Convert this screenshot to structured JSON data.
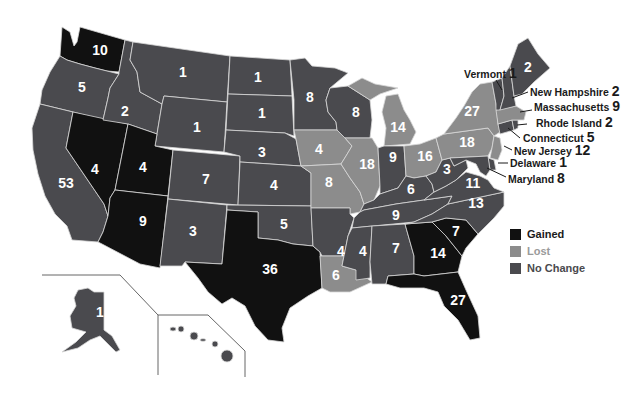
{
  "colors": {
    "gained": "#111111",
    "lost": "#8c8c8c",
    "no_change": "#4a4a4e",
    "border": "#d8d8d8",
    "label_dark": "#1a1a1a",
    "label_light": "#ffffff"
  },
  "legend": {
    "items": [
      {
        "key": "gained",
        "label": "Gained",
        "color": "#111111",
        "text_color": "#1a1a1a"
      },
      {
        "key": "lost",
        "label": "Lost",
        "color": "#8c8c8c",
        "text_color": "#9a9a9a"
      },
      {
        "key": "no_change",
        "label": "No Change",
        "color": "#4a4a4e",
        "text_color": "#4a4a4e"
      }
    ]
  },
  "states": {
    "WA": {
      "name": "Washington",
      "seats": "10",
      "status": "gained"
    },
    "OR": {
      "name": "Oregon",
      "seats": "5",
      "status": "no_change"
    },
    "CA": {
      "name": "California",
      "seats": "53",
      "status": "no_change"
    },
    "NV": {
      "name": "Nevada",
      "seats": "4",
      "status": "gained"
    },
    "ID": {
      "name": "Idaho",
      "seats": "2",
      "status": "no_change"
    },
    "MT": {
      "name": "Montana",
      "seats": "1",
      "status": "no_change"
    },
    "WY": {
      "name": "Wyoming",
      "seats": "1",
      "status": "no_change"
    },
    "UT": {
      "name": "Utah",
      "seats": "4",
      "status": "gained"
    },
    "AZ": {
      "name": "Arizona",
      "seats": "9",
      "status": "gained"
    },
    "CO": {
      "name": "Colorado",
      "seats": "7",
      "status": "no_change"
    },
    "NM": {
      "name": "New Mexico",
      "seats": "3",
      "status": "no_change"
    },
    "ND": {
      "name": "North Dakota",
      "seats": "1",
      "status": "no_change"
    },
    "SD": {
      "name": "South Dakota",
      "seats": "1",
      "status": "no_change"
    },
    "NE": {
      "name": "Nebraska",
      "seats": "3",
      "status": "no_change"
    },
    "KS": {
      "name": "Kansas",
      "seats": "4",
      "status": "no_change"
    },
    "OK": {
      "name": "Oklahoma",
      "seats": "5",
      "status": "no_change"
    },
    "TX": {
      "name": "Texas",
      "seats": "36",
      "status": "gained"
    },
    "MN": {
      "name": "Minnesota",
      "seats": "8",
      "status": "no_change"
    },
    "IA": {
      "name": "Iowa",
      "seats": "4",
      "status": "lost"
    },
    "MO": {
      "name": "Missouri",
      "seats": "8",
      "status": "lost"
    },
    "AR": {
      "name": "Arkansas",
      "seats": "4",
      "status": "no_change"
    },
    "LA": {
      "name": "Louisiana",
      "seats": "6",
      "status": "lost"
    },
    "WI": {
      "name": "Wisconsin",
      "seats": "8",
      "status": "no_change"
    },
    "IL": {
      "name": "Illinois",
      "seats": "18",
      "status": "lost"
    },
    "MI": {
      "name": "Michigan",
      "seats": "14",
      "status": "lost"
    },
    "IN": {
      "name": "Indiana",
      "seats": "9",
      "status": "no_change"
    },
    "OH": {
      "name": "Ohio",
      "seats": "16",
      "status": "lost"
    },
    "KY": {
      "name": "Kentucky",
      "seats": "6",
      "status": "no_change"
    },
    "TN": {
      "name": "Tennessee",
      "seats": "9",
      "status": "no_change"
    },
    "MS": {
      "name": "Mississippi",
      "seats": "4",
      "status": "no_change"
    },
    "AL": {
      "name": "Alabama",
      "seats": "7",
      "status": "no_change"
    },
    "GA": {
      "name": "Georgia",
      "seats": "14",
      "status": "gained"
    },
    "FL": {
      "name": "Florida",
      "seats": "27",
      "status": "gained"
    },
    "SC": {
      "name": "South Carolina",
      "seats": "7",
      "status": "gained"
    },
    "NC": {
      "name": "North Carolina",
      "seats": "13",
      "status": "no_change"
    },
    "VA": {
      "name": "Virginia",
      "seats": "11",
      "status": "no_change"
    },
    "WV": {
      "name": "West Virginia",
      "seats": "3",
      "status": "no_change"
    },
    "PA": {
      "name": "Pennsylvania",
      "seats": "18",
      "status": "lost"
    },
    "NY": {
      "name": "New York",
      "seats": "27",
      "status": "lost"
    },
    "ME": {
      "name": "Maine",
      "seats": "2",
      "status": "no_change"
    },
    "VT": {
      "name": "Vermont",
      "seats": "1",
      "status": "no_change"
    },
    "NH": {
      "name": "New Hampshire",
      "seats": "2",
      "status": "no_change"
    },
    "MA": {
      "name": "Massachusetts",
      "seats": "9",
      "status": "lost"
    },
    "RI": {
      "name": "Rhode Island",
      "seats": "2",
      "status": "no_change"
    },
    "CT": {
      "name": "Connecticut",
      "seats": "5",
      "status": "no_change"
    },
    "NJ": {
      "name": "New Jersey",
      "seats": "12",
      "status": "lost"
    },
    "DE": {
      "name": "Delaware",
      "seats": "1",
      "status": "no_change"
    },
    "MD": {
      "name": "Maryland",
      "seats": "8",
      "status": "no_change"
    },
    "AK": {
      "name": "Alaska",
      "seats": "1",
      "status": "no_change"
    },
    "HI": {
      "name": "Hawaii",
      "seats": "2",
      "status": "no_change"
    }
  }
}
